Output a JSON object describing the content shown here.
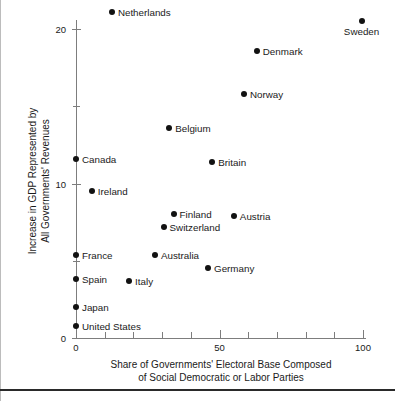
{
  "chart_data": {
    "type": "scatter",
    "title": "",
    "xlabel": "Share of Governments' Electoral Base Composed of Social Democratic or Labor Parties",
    "ylabel": "Increase in GDP Represented by All Governments' Revenues",
    "xlim": [
      0,
      105
    ],
    "ylim": [
      0,
      21.5
    ],
    "grid": false,
    "legend": "none",
    "x_major_ticks": [
      0,
      50,
      100
    ],
    "x_minor_ticks": [
      10,
      20,
      30,
      40,
      60,
      70,
      80,
      90
    ],
    "x_tick_labels": [
      "0",
      "50",
      "100"
    ],
    "y_major_ticks": [
      0,
      10,
      20
    ],
    "y_minor_ticks": [
      5,
      15
    ],
    "y_tick_labels": [
      "0",
      "10",
      "20"
    ],
    "points": [
      {
        "label": "Netherlands",
        "x": 12.5,
        "y": 21.1,
        "label_pos": "right"
      },
      {
        "label": "Sweden",
        "x": 99.5,
        "y": 20.5,
        "label_pos": "below"
      },
      {
        "label": "Denmark",
        "x": 63.0,
        "y": 18.6,
        "label_pos": "right"
      },
      {
        "label": "Norway",
        "x": 58.5,
        "y": 15.8,
        "label_pos": "right"
      },
      {
        "label": "Belgium",
        "x": 32.5,
        "y": 13.6,
        "label_pos": "right"
      },
      {
        "label": "Britain",
        "x": 47.5,
        "y": 11.4,
        "label_pos": "right"
      },
      {
        "label": "Canada",
        "x": 0.0,
        "y": 11.6,
        "label_pos": "right"
      },
      {
        "label": "Ireland",
        "x": 5.5,
        "y": 9.5,
        "label_pos": "right"
      },
      {
        "label": "Finland",
        "x": 34.0,
        "y": 8.0,
        "label_pos": "right"
      },
      {
        "label": "Austria",
        "x": 55.0,
        "y": 7.9,
        "label_pos": "right"
      },
      {
        "label": "Switzerland",
        "x": 30.5,
        "y": 7.2,
        "label_pos": "right"
      },
      {
        "label": "France",
        "x": 0.0,
        "y": 5.4,
        "label_pos": "right"
      },
      {
        "label": "Australia",
        "x": 27.5,
        "y": 5.4,
        "label_pos": "right"
      },
      {
        "label": "Germany",
        "x": 46.0,
        "y": 4.5,
        "label_pos": "right"
      },
      {
        "label": "Spain",
        "x": 0.0,
        "y": 3.8,
        "label_pos": "right"
      },
      {
        "label": "Italy",
        "x": 18.5,
        "y": 3.7,
        "label_pos": "right"
      },
      {
        "label": "Japan",
        "x": 0.0,
        "y": 2.0,
        "label_pos": "right"
      },
      {
        "label": "United States",
        "x": 0.0,
        "y": 0.8,
        "label_pos": "right"
      }
    ],
    "axis_title_x_lines": [
      "Share of Governments' Electoral Base Composed",
      "of Social Democratic or Labor Parties"
    ],
    "axis_title_y_lines": [
      "Increase in GDP Represented by",
      "All Governments' Revenues"
    ],
    "colors": {
      "point": "#121212",
      "axis": "#7d7d7d",
      "text": "#1a1a1a",
      "background": "#ffffff",
      "rule": "#2a2a2a"
    }
  }
}
